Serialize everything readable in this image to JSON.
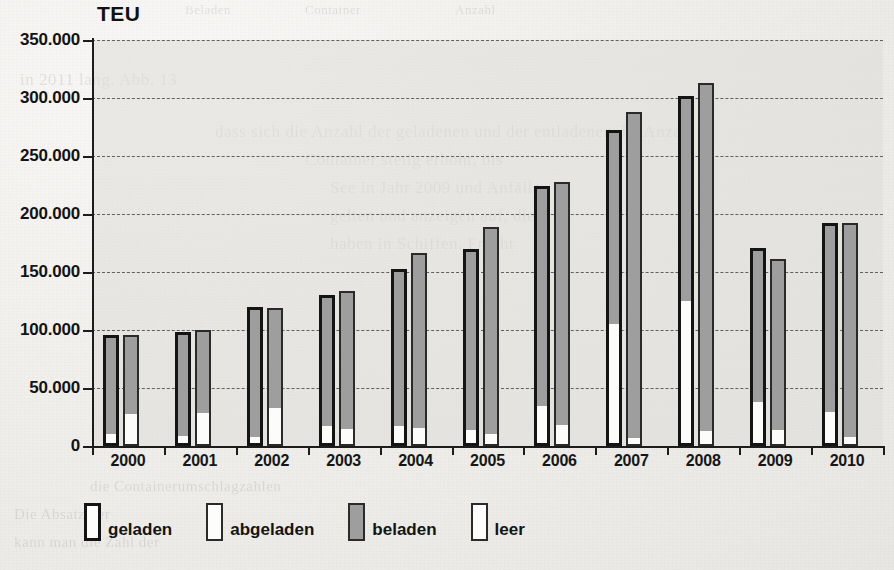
{
  "chart_data": {
    "type": "bar",
    "title": "",
    "ylabel": "TEU",
    "xlabel": "",
    "ylim": [
      0,
      350000
    ],
    "ytick_labels": [
      "0",
      "50.000",
      "100.000",
      "150.000",
      "200.000",
      "250.000",
      "300.000",
      "350.000"
    ],
    "ytick_values": [
      0,
      50000,
      100000,
      150000,
      200000,
      250000,
      300000,
      350000
    ],
    "grid": true,
    "legend_position": "bottom",
    "categories": [
      "2000",
      "2001",
      "2002",
      "2003",
      "2004",
      "2005",
      "2006",
      "2007",
      "2008",
      "2009",
      "2010"
    ],
    "legend": [
      {
        "key": "geladen",
        "label": "geladen",
        "swatch": "thick-black-outline"
      },
      {
        "key": "abgeladen",
        "label": "abgeladen",
        "swatch": "thin-outline"
      },
      {
        "key": "beladen",
        "label": "beladen",
        "swatch": "gray-fill"
      },
      {
        "key": "leer",
        "label": "leer",
        "swatch": "white-fill"
      }
    ],
    "series": [
      {
        "name": "geladen",
        "note": "loaded containers; bar total = beladen + leer",
        "values": [
          96000,
          98000,
          120000,
          130000,
          153000,
          170000,
          224000,
          272000,
          302000,
          171000,
          192000
        ],
        "leer_values": [
          8000,
          6000,
          5000,
          15000,
          15000,
          11000,
          32000,
          103000,
          122000,
          35000,
          27000
        ]
      },
      {
        "name": "abgeladen",
        "note": "unloaded containers; bar total = beladen + leer",
        "values": [
          96000,
          100000,
          119000,
          134000,
          166000,
          189000,
          228000,
          288000,
          313000,
          161000,
          192000
        ],
        "leer_values": [
          26000,
          27000,
          31000,
          13000,
          14000,
          9000,
          16000,
          5000,
          11000,
          12000,
          6000
        ]
      }
    ]
  },
  "ghost_text": [
    {
      "t": "dass sich die Anzahl der geladenen und der entladenen die Anzahl",
      "x": 215,
      "y": 122,
      "s": 17
    },
    {
      "t": "Container stetig erhöht, bis",
      "x": 305,
      "y": 150,
      "s": 17
    },
    {
      "t": "See in Jahr 2009 und Anfälle",
      "x": 330,
      "y": 178,
      "s": 17
    },
    {
      "t": "gelten und anzeigen auf, die",
      "x": 330,
      "y": 206,
      "s": 17
    },
    {
      "t": "haben in Schiffen. Fracht",
      "x": 330,
      "y": 234,
      "s": 17
    },
    {
      "t": "in 2011 lang. Abb. 13",
      "x": 20,
      "y": 70,
      "s": 17
    },
    {
      "t": "Beladen",
      "x": 185,
      "y": 2,
      "s": 13
    },
    {
      "t": "Anzahl",
      "x": 455,
      "y": 2,
      "s": 13
    },
    {
      "t": "Container",
      "x": 305,
      "y": 2,
      "s": 13
    },
    {
      "t": "die Containerumschlagzahlen",
      "x": 90,
      "y": 478,
      "s": 15
    },
    {
      "t": "Die Absatz der",
      "x": 14,
      "y": 506,
      "s": 15
    },
    {
      "t": "kann man die Zahl der",
      "x": 14,
      "y": 534,
      "s": 15
    }
  ]
}
